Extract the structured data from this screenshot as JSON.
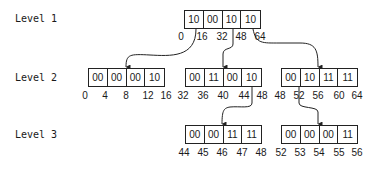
{
  "levels": [
    {
      "label": "Level 1"
    },
    {
      "label": "Level 2"
    },
    {
      "label": "Level 3"
    }
  ],
  "level1": {
    "boxes": [
      {
        "cells": [
          "10",
          "00",
          "10",
          "10"
        ],
        "ticks": [
          "0",
          "16",
          "32",
          "48",
          "64"
        ]
      }
    ]
  },
  "level2": {
    "boxes": [
      {
        "cells": [
          "00",
          "00",
          "00",
          "10"
        ],
        "ticks": [
          "0",
          "4",
          "8",
          "12",
          "16"
        ]
      },
      {
        "cells": [
          "00",
          "11",
          "00",
          "10"
        ],
        "ticks": [
          "32",
          "36",
          "40",
          "44",
          "48"
        ]
      },
      {
        "cells": [
          "00",
          "10",
          "11",
          "11"
        ],
        "ticks": [
          "48",
          "52",
          "56",
          "60",
          "64"
        ]
      }
    ]
  },
  "level3": {
    "boxes": [
      {
        "cells": [
          "00",
          "00",
          "11",
          "11"
        ],
        "ticks": [
          "44",
          "45",
          "46",
          "47",
          "48"
        ]
      },
      {
        "cells": [
          "00",
          "00",
          "00",
          "11"
        ],
        "ticks": [
          "52",
          "53",
          "54",
          "55",
          "56"
        ]
      }
    ]
  },
  "colors": {
    "line": "#222222",
    "background": "#ffffff"
  }
}
